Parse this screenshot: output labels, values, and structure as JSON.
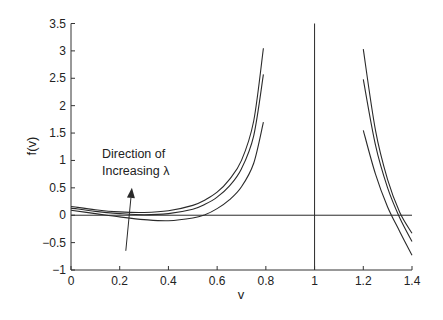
{
  "chart_data": {
    "type": "line",
    "title": "",
    "xlabel": "v",
    "ylabel": "f(v)",
    "xlim": [
      0,
      1.4
    ],
    "ylim": [
      -1,
      3.5
    ],
    "xticks": [
      0,
      0.2,
      0.4,
      0.6,
      0.8,
      1,
      1.2,
      1.4
    ],
    "xtick_labels": [
      "0",
      "0.2",
      "0.4",
      "0.6",
      "0.8",
      "1",
      "1.2",
      "1.4"
    ],
    "yticks": [
      -1,
      -0.5,
      0,
      0.5,
      1,
      1.5,
      2,
      2.5,
      3,
      3.5
    ],
    "ytick_labels": [
      "−1",
      "−0.5",
      "0",
      "0.5",
      "1",
      "1.5",
      "2",
      "2.5",
      "3",
      "3.5"
    ],
    "grid": false,
    "legend": null,
    "reference_lines": [
      {
        "orientation": "horizontal",
        "value": 0
      },
      {
        "orientation": "vertical",
        "value": 1
      }
    ],
    "series": [
      {
        "name": "lambda_3 (largest)",
        "segments": [
          {
            "x": [
              0,
              0.1,
              0.2,
              0.3,
              0.4,
              0.5,
              0.55,
              0.6,
              0.65,
              0.7,
              0.75,
              0.79
            ],
            "y": [
              0.16,
              0.1,
              0.06,
              0.05,
              0.08,
              0.18,
              0.28,
              0.42,
              0.65,
              1.0,
              1.72,
              3.05
            ]
          },
          {
            "x": [
              1.2,
              1.25,
              1.3,
              1.35,
              1.4
            ],
            "y": [
              3.03,
              1.55,
              0.65,
              0.05,
              -0.33
            ]
          }
        ]
      },
      {
        "name": "lambda_2",
        "segments": [
          {
            "x": [
              0,
              0.1,
              0.2,
              0.3,
              0.4,
              0.5,
              0.55,
              0.6,
              0.65,
              0.7,
              0.75,
              0.79
            ],
            "y": [
              0.13,
              0.07,
              0.03,
              0.01,
              0.03,
              0.11,
              0.2,
              0.33,
              0.53,
              0.85,
              1.45,
              2.57
            ]
          },
          {
            "x": [
              1.2,
              1.25,
              1.3,
              1.35,
              1.4
            ],
            "y": [
              2.48,
              1.28,
              0.5,
              -0.05,
              -0.48
            ]
          }
        ]
      },
      {
        "name": "lambda_1 (smallest)",
        "segments": [
          {
            "x": [
              0,
              0.1,
              0.2,
              0.3,
              0.4,
              0.5,
              0.55,
              0.6,
              0.65,
              0.7,
              0.75,
              0.79
            ],
            "y": [
              0.09,
              0.03,
              -0.03,
              -0.08,
              -0.1,
              -0.05,
              0.01,
              0.12,
              0.28,
              0.52,
              0.95,
              1.7
            ]
          },
          {
            "x": [
              1.2,
              1.25,
              1.3,
              1.35,
              1.4
            ],
            "y": [
              1.55,
              0.75,
              0.15,
              -0.3,
              -0.73
            ]
          }
        ]
      }
    ],
    "annotations": [
      {
        "text": [
          "Direction of",
          "Increasing λ"
        ],
        "x": 0.12,
        "y": 1.05
      },
      {
        "type": "arrow",
        "from": [
          0.225,
          -0.65
        ],
        "to": [
          0.25,
          0.5
        ],
        "label": "Direction of Increasing λ"
      }
    ]
  },
  "colors": {
    "line": "#2a2a2a",
    "axis": "#333333",
    "background": "#ffffff"
  }
}
